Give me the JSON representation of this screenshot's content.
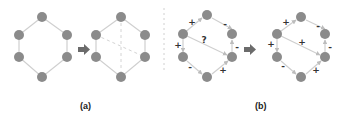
{
  "panels": {
    "a": {
      "label": "(a)"
    },
    "b": {
      "label": "(b)"
    }
  },
  "colors": {
    "node": "#8b8b8b",
    "edge": "#cfcfcf",
    "arrow": "#6b6b6b",
    "sign": "#333333"
  },
  "b_left_signs": {
    "top_left": "+",
    "top_right": "-",
    "left": "+",
    "right": "-",
    "diagonal": "?",
    "bottom_left": "-",
    "bottom_right": "+"
  },
  "b_right_signs": {
    "top_left": "+",
    "top_right": "-",
    "left": "+",
    "right": "-",
    "diagonal": "+",
    "bottom_left": "-",
    "bottom_right": "+"
  }
}
